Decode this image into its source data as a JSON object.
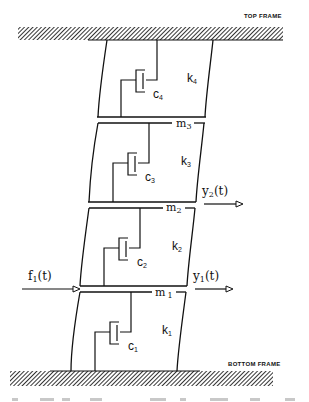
{
  "diagram": {
    "type": "structural-dynamics-schematic",
    "frames": {
      "top": "TOP FRAME",
      "bottom": "BOTTOM FRAME"
    },
    "masses": [
      {
        "id": "m1",
        "label": "m",
        "sub": "1"
      },
      {
        "id": "m2",
        "label": "m",
        "sub": "2"
      },
      {
        "id": "m3",
        "label": "m",
        "sub": "3"
      }
    ],
    "springs": [
      {
        "id": "k1",
        "label": "k",
        "sub": "1"
      },
      {
        "id": "k2",
        "label": "k",
        "sub": "2"
      },
      {
        "id": "k3",
        "label": "k",
        "sub": "3"
      },
      {
        "id": "k4",
        "label": "k",
        "sub": "4"
      }
    ],
    "dampers": [
      {
        "id": "c1",
        "label": "c",
        "sub": "1"
      },
      {
        "id": "c2",
        "label": "c",
        "sub": "2"
      },
      {
        "id": "c3",
        "label": "c",
        "sub": "3"
      },
      {
        "id": "c4",
        "label": "c",
        "sub": "4"
      }
    ],
    "input_force": {
      "label": "f",
      "sub": "1",
      "arg": "(t)"
    },
    "outputs": [
      {
        "label": "y",
        "sub": "1",
        "arg": "(t)"
      },
      {
        "label": "y",
        "sub": "2",
        "arg": "(t)"
      }
    ],
    "colors": {
      "ink": "#111111",
      "background": "#ffffff"
    }
  }
}
